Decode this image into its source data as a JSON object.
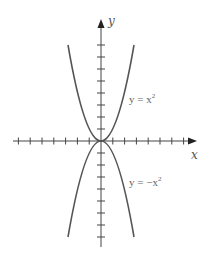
{
  "chart_data": {
    "type": "line",
    "title": "",
    "xlabel": "x",
    "ylabel": "y",
    "grid": false,
    "legend_position": "inline-annotations",
    "x_ticks_each_side": 7,
    "y_ticks_each_side": 8,
    "xlim": [
      -7.5,
      8
    ],
    "ylim": [
      -8.8,
      10
    ],
    "series": [
      {
        "name": "y = x^2",
        "label_text": "y = x",
        "label_exponent": "2",
        "function": "x^2",
        "x_range": [
          -2.75,
          2.75
        ],
        "points": [
          [
            -2.75,
            7.6
          ],
          [
            -2,
            4
          ],
          [
            -1,
            1
          ],
          [
            0,
            0
          ],
          [
            1,
            1
          ],
          [
            2,
            4
          ],
          [
            2.75,
            7.6
          ]
        ],
        "color": "#555555"
      },
      {
        "name": "y = -x^2",
        "label_text": "y = −x",
        "label_exponent": "2",
        "function": "-x^2",
        "x_range": [
          -2.75,
          2.75
        ],
        "points": [
          [
            -2.75,
            -7.6
          ],
          [
            -2,
            -4
          ],
          [
            -1,
            -1
          ],
          [
            0,
            0
          ],
          [
            1,
            -1
          ],
          [
            2,
            -4
          ],
          [
            2.75,
            -7.6
          ]
        ],
        "color": "#555555"
      }
    ]
  },
  "axes": {
    "x_label": "x",
    "y_label": "y",
    "color": "#444444"
  }
}
